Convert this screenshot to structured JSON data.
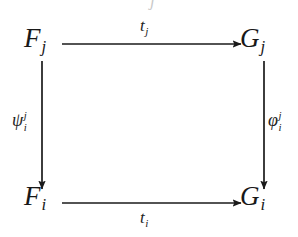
{
  "figure": {
    "kind": "commutative-diagram",
    "shape": "square",
    "background_color": "#ffffff",
    "ink_color": "#1a1a1a"
  },
  "nodes": {
    "top_left": {
      "base": "F",
      "sub": "j",
      "text": "F_j"
    },
    "top_right": {
      "base": "G",
      "sub": "j",
      "text": "G_j"
    },
    "bottom_left": {
      "base": "F",
      "sub": "i",
      "text": "F_i"
    },
    "bottom_right": {
      "base": "G",
      "sub": "i",
      "text": "G_i"
    }
  },
  "edges": {
    "top": {
      "label_base": "t",
      "label_sub": "j",
      "label": "t_j",
      "from": "F_j",
      "to": "G_j",
      "direction": "right"
    },
    "bottom": {
      "label_base": "t",
      "label_sub": "i",
      "label": "t_i",
      "from": "F_i",
      "to": "G_i",
      "direction": "right"
    },
    "left": {
      "label_base": "ψ",
      "label_sup": "j",
      "label_sub": "i",
      "label": "psi_i^j",
      "from": "F_j",
      "to": "F_i",
      "direction": "down"
    },
    "right": {
      "label_base": "φ",
      "label_sup": "j",
      "label_sub": "i",
      "label": "phi_i^j",
      "from": "G_j",
      "to": "G_i",
      "direction": "down"
    }
  },
  "artifacts": {
    "top_edge_crop": "j"
  }
}
